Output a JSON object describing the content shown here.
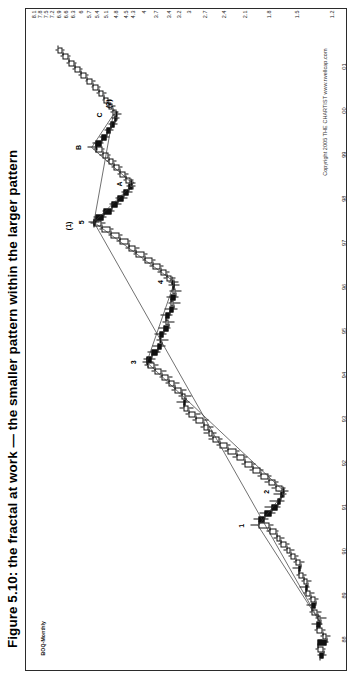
{
  "figure": {
    "title": "Figure 5.10: the fractal at work — the smaller pattern within the larger pattern",
    "series_label": "BOQ-Monthly",
    "copyright": "Copyright 2005  THE CHARTIST   www.rwellcap.com"
  },
  "chart_data": {
    "type": "ohlc",
    "title": "BOQ-Monthly",
    "xlabel": "",
    "ylabel": "",
    "scale": "logarithmic",
    "grid": false,
    "legend": "none",
    "price_axis_side": "right",
    "ylim": [
      1.2,
      8.1
    ],
    "price_ticks": [
      "8.1",
      "7.8",
      "7.5",
      "7.2",
      "6.9",
      "6.6",
      "6.3",
      "6",
      "5.7",
      "5.4",
      "5.1",
      "4.8",
      "4.5",
      "4.3",
      "4",
      "3.7",
      "3.4",
      "3.2",
      "3",
      "2.7",
      "2.4",
      "2.1",
      "1.8",
      "1.5",
      "1.2"
    ],
    "date_ticks": [
      "88",
      "89",
      "90",
      "91",
      "92",
      "93",
      "94",
      "95",
      "96",
      "97",
      "98",
      "99",
      "00",
      "01"
    ],
    "annotations": [
      {
        "text": "1",
        "x": 22.0,
        "y": 2.02
      },
      {
        "text": "2",
        "x": 27.5,
        "y": 1.72
      },
      {
        "text": "3",
        "x": 48.5,
        "y": 4.02
      },
      {
        "text": "4",
        "x": 61.5,
        "y": 3.38
      },
      {
        "text": "5",
        "x": 71.2,
        "y": 5.62
      },
      {
        "text": "(1)",
        "x": 70.6,
        "y": 6.1
      },
      {
        "text": "A",
        "x": 77.4,
        "y": 4.42
      },
      {
        "text": "B",
        "x": 83.3,
        "y": 5.72
      },
      {
        "text": "C",
        "x": 88.6,
        "y": 5.0
      },
      {
        "text": "(2)",
        "x": 90.4,
        "y": 4.72
      }
    ],
    "trendlines": [
      {
        "name": "impulse-1-2-3-4-5",
        "points": [
          [
            6.0,
            1.28
          ],
          [
            22.0,
            1.92
          ],
          [
            27.5,
            1.62
          ],
          [
            48.5,
            3.92
          ],
          [
            61.5,
            3.28
          ],
          [
            71.2,
            5.5
          ]
        ]
      },
      {
        "name": "correction-5-A-B-C",
        "points": [
          [
            71.2,
            5.5
          ],
          [
            77.4,
            4.28
          ],
          [
            83.3,
            5.58
          ],
          [
            88.6,
            4.86
          ]
        ]
      },
      {
        "name": "degree-1-2",
        "points": [
          [
            6.0,
            1.28
          ],
          [
            71.2,
            5.5
          ],
          [
            88.6,
            4.86
          ]
        ]
      }
    ],
    "bars": [
      [
        1.0,
        1.31,
        1.24,
        1.3,
        1.26
      ],
      [
        2.0,
        1.33,
        1.25,
        1.26,
        1.31
      ],
      [
        3.0,
        1.3,
        1.22,
        1.31,
        1.24
      ],
      [
        4.0,
        1.29,
        1.21,
        1.24,
        1.27
      ],
      [
        5.0,
        1.34,
        1.25,
        1.27,
        1.32
      ],
      [
        6.0,
        1.36,
        1.27,
        1.32,
        1.29
      ],
      [
        7.0,
        1.33,
        1.24,
        1.29,
        1.31
      ],
      [
        8.0,
        1.38,
        1.28,
        1.31,
        1.36
      ],
      [
        9.0,
        1.41,
        1.32,
        1.36,
        1.33
      ],
      [
        10.0,
        1.39,
        1.3,
        1.33,
        1.37
      ],
      [
        11.0,
        1.44,
        1.34,
        1.37,
        1.42
      ],
      [
        12.0,
        1.47,
        1.38,
        1.42,
        1.4
      ],
      [
        13.0,
        1.45,
        1.36,
        1.4,
        1.44
      ],
      [
        14.0,
        1.5,
        1.41,
        1.44,
        1.48
      ],
      [
        15.0,
        1.54,
        1.45,
        1.48,
        1.46
      ],
      [
        16.0,
        1.53,
        1.43,
        1.46,
        1.51
      ],
      [
        17.0,
        1.58,
        1.48,
        1.51,
        1.56
      ],
      [
        18.0,
        1.63,
        1.52,
        1.56,
        1.6
      ],
      [
        19.0,
        1.68,
        1.57,
        1.6,
        1.66
      ],
      [
        20.0,
        1.74,
        1.62,
        1.66,
        1.71
      ],
      [
        21.0,
        1.82,
        1.68,
        1.71,
        1.79
      ],
      [
        22.0,
        2.02,
        1.74,
        1.79,
        1.92
      ],
      [
        23.0,
        1.98,
        1.8,
        1.92,
        1.84
      ],
      [
        24.0,
        1.9,
        1.72,
        1.84,
        1.76
      ],
      [
        25.0,
        1.84,
        1.66,
        1.76,
        1.7
      ],
      [
        26.0,
        1.78,
        1.62,
        1.7,
        1.66
      ],
      [
        27.0,
        1.74,
        1.6,
        1.66,
        1.63
      ],
      [
        27.5,
        1.7,
        1.58,
        1.63,
        1.64
      ],
      [
        28.0,
        1.76,
        1.61,
        1.64,
        1.72
      ],
      [
        29.0,
        1.84,
        1.68,
        1.72,
        1.8
      ],
      [
        30.0,
        1.93,
        1.76,
        1.8,
        1.89
      ],
      [
        31.0,
        2.03,
        1.85,
        1.89,
        1.99
      ],
      [
        32.0,
        2.14,
        1.95,
        1.99,
        2.1
      ],
      [
        33.0,
        2.26,
        2.06,
        2.1,
        2.21
      ],
      [
        34.0,
        2.38,
        2.17,
        2.21,
        2.33
      ],
      [
        35.0,
        2.51,
        2.29,
        2.33,
        2.46
      ],
      [
        36.0,
        2.64,
        2.41,
        2.46,
        2.58
      ],
      [
        37.0,
        2.72,
        2.5,
        2.58,
        2.64
      ],
      [
        38.0,
        2.78,
        2.56,
        2.64,
        2.72
      ],
      [
        39.0,
        2.92,
        2.64,
        2.72,
        2.86
      ],
      [
        40.0,
        3.06,
        2.78,
        2.86,
        3.0
      ],
      [
        41.0,
        3.18,
        2.9,
        3.0,
        3.1
      ],
      [
        42.0,
        3.24,
        2.98,
        3.1,
        3.06
      ],
      [
        43.0,
        3.2,
        2.94,
        3.06,
        3.14
      ],
      [
        44.0,
        3.34,
        3.04,
        3.14,
        3.28
      ],
      [
        45.0,
        3.48,
        3.18,
        3.28,
        3.42
      ],
      [
        46.0,
        3.62,
        3.32,
        3.42,
        3.56
      ],
      [
        47.0,
        3.8,
        3.46,
        3.56,
        3.74
      ],
      [
        48.0,
        3.98,
        3.64,
        3.74,
        3.9
      ],
      [
        48.5,
        4.02,
        3.76,
        3.9,
        3.92
      ],
      [
        49.0,
        4.0,
        3.7,
        3.92,
        3.8
      ],
      [
        50.0,
        3.9,
        3.58,
        3.8,
        3.66
      ],
      [
        51.0,
        3.78,
        3.48,
        3.66,
        3.56
      ],
      [
        52.0,
        3.68,
        3.4,
        3.56,
        3.62
      ],
      [
        53.0,
        3.74,
        3.46,
        3.62,
        3.52
      ],
      [
        54.0,
        3.64,
        3.36,
        3.52,
        3.42
      ],
      [
        55.0,
        3.54,
        3.28,
        3.42,
        3.48
      ],
      [
        56.0,
        3.58,
        3.32,
        3.48,
        3.38
      ],
      [
        57.0,
        3.5,
        3.22,
        3.38,
        3.3
      ],
      [
        58.0,
        3.42,
        3.16,
        3.3,
        3.36
      ],
      [
        59.0,
        3.46,
        3.2,
        3.36,
        3.26
      ],
      [
        60.0,
        3.38,
        3.14,
        3.26,
        3.32
      ],
      [
        61.0,
        3.42,
        3.18,
        3.32,
        3.3
      ],
      [
        61.5,
        3.4,
        3.2,
        3.3,
        3.34
      ],
      [
        62.0,
        3.52,
        3.26,
        3.34,
        3.46
      ],
      [
        63.0,
        3.66,
        3.38,
        3.46,
        3.6
      ],
      [
        64.0,
        3.84,
        3.52,
        3.6,
        3.78
      ],
      [
        65.0,
        4.04,
        3.7,
        3.78,
        3.98
      ],
      [
        66.0,
        4.26,
        3.9,
        3.98,
        4.2
      ],
      [
        67.0,
        4.5,
        4.1,
        4.2,
        4.42
      ],
      [
        68.0,
        4.76,
        4.34,
        4.42,
        4.68
      ],
      [
        69.0,
        5.02,
        4.58,
        4.68,
        4.94
      ],
      [
        70.0,
        5.32,
        4.86,
        4.94,
        5.24
      ],
      [
        71.0,
        5.62,
        5.12,
        5.24,
        5.5
      ],
      [
        71.2,
        5.7,
        5.3,
        5.5,
        5.44
      ],
      [
        72.0,
        5.52,
        5.06,
        5.44,
        5.16
      ],
      [
        73.0,
        5.22,
        4.82,
        5.16,
        4.92
      ],
      [
        74.0,
        4.98,
        4.62,
        4.92,
        4.72
      ],
      [
        75.0,
        4.78,
        4.44,
        4.72,
        4.54
      ],
      [
        76.0,
        4.6,
        4.3,
        4.54,
        4.4
      ],
      [
        77.0,
        4.46,
        4.22,
        4.4,
        4.3
      ],
      [
        77.4,
        4.42,
        4.2,
        4.3,
        4.34
      ],
      [
        78.0,
        4.56,
        4.28,
        4.34,
        4.5
      ],
      [
        79.0,
        4.72,
        4.42,
        4.5,
        4.66
      ],
      [
        80.0,
        4.9,
        4.58,
        4.66,
        4.84
      ],
      [
        81.0,
        5.08,
        4.76,
        4.84,
        5.02
      ],
      [
        82.0,
        5.3,
        4.94,
        5.02,
        5.22
      ],
      [
        83.0,
        5.52,
        5.14,
        5.22,
        5.44
      ],
      [
        83.3,
        5.72,
        5.36,
        5.44,
        5.46
      ],
      [
        84.0,
        5.54,
        5.16,
        5.46,
        5.24
      ],
      [
        85.0,
        5.3,
        4.98,
        5.24,
        5.08
      ],
      [
        86.0,
        5.14,
        4.84,
        5.08,
        4.94
      ],
      [
        87.0,
        5.0,
        4.72,
        4.94,
        4.82
      ],
      [
        88.0,
        4.9,
        4.66,
        4.82,
        4.76
      ],
      [
        88.6,
        4.86,
        4.62,
        4.76,
        4.8
      ],
      [
        89.0,
        4.94,
        4.7,
        4.8,
        4.88
      ],
      [
        90.0,
        5.06,
        4.78,
        4.88,
        5.0
      ],
      [
        91.0,
        5.22,
        4.92,
        5.0,
        5.16
      ],
      [
        92.0,
        5.4,
        5.08,
        5.16,
        5.34
      ],
      [
        93.0,
        5.6,
        5.26,
        5.34,
        5.54
      ],
      [
        94.0,
        5.82,
        5.46,
        5.54,
        5.76
      ],
      [
        95.0,
        6.06,
        5.68,
        5.76,
        6.0
      ],
      [
        96.0,
        6.32,
        5.92,
        6.0,
        6.24
      ],
      [
        97.0,
        6.56,
        6.16,
        6.24,
        6.48
      ],
      [
        98.0,
        6.8,
        6.4,
        6.48,
        6.72
      ],
      [
        99.0,
        7.04,
        6.64,
        6.72,
        6.96
      ]
    ]
  }
}
